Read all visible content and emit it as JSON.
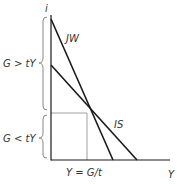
{
  "diagram": {
    "axes": {
      "y_label": "i",
      "x_label": "Y"
    },
    "curves": [
      {
        "name": "JW",
        "label": "JW"
      },
      {
        "name": "IS",
        "label": "IS"
      }
    ],
    "regions": [
      {
        "name": "upper",
        "label": "G > tY"
      },
      {
        "name": "lower",
        "label": "G < tY"
      }
    ],
    "x_marker_label": "Y = G/t",
    "colors": {
      "line": "#1a1a1a",
      "guide": "#999999",
      "brace": "#888888",
      "text": "#333333"
    }
  }
}
